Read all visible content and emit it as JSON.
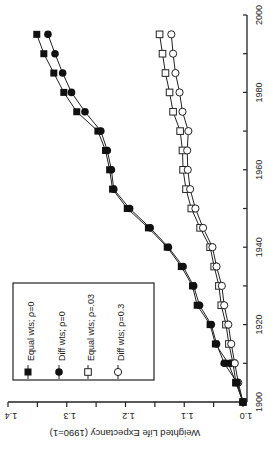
{
  "chart_data": {
    "type": "line",
    "orientation": "rotated-90-ccw",
    "title": "",
    "xlabel": "",
    "ylabel": "Weighted Life Expectancy (1990=1)",
    "xlim": [
      1900,
      2000
    ],
    "ylim": [
      1.0,
      1.4
    ],
    "xticks": [
      1900,
      1910,
      1920,
      1930,
      1940,
      1950,
      1960,
      1970,
      1980,
      1990,
      2000
    ],
    "xtick_labels": [
      "1900",
      "1920",
      "1940",
      "1960",
      "1980",
      "2000"
    ],
    "yticks": [
      1.0,
      1.05,
      1.1,
      1.15,
      1.2,
      1.25,
      1.3,
      1.35,
      1.4
    ],
    "ytick_labels": [
      "1.0",
      "1.1",
      "1.2",
      "1.3",
      "1.4"
    ],
    "grid": false,
    "legend_position": "bottom-left",
    "x": [
      1900,
      1905,
      1910,
      1915,
      1920,
      1925,
      1930,
      1935,
      1940,
      1945,
      1950,
      1955,
      1960,
      1965,
      1970,
      1975,
      1980,
      1985,
      1990,
      1995
    ],
    "series": [
      {
        "name": "Equal wts; ρ=0",
        "marker": "filled-square",
        "values": [
          1.0,
          1.012,
          1.025,
          1.047,
          1.056,
          1.078,
          1.086,
          1.105,
          1.129,
          1.161,
          1.197,
          1.222,
          1.227,
          1.234,
          1.247,
          1.283,
          1.305,
          1.322,
          1.339,
          1.351
        ]
      },
      {
        "name": "Diff wts; ρ=0",
        "marker": "filled-circle",
        "values": [
          1.0,
          1.01,
          1.032,
          1.045,
          1.054,
          1.074,
          1.084,
          1.102,
          1.127,
          1.158,
          1.193,
          1.22,
          1.224,
          1.231,
          1.242,
          1.269,
          1.292,
          1.307,
          1.32,
          1.332
        ]
      },
      {
        "name": "Equal wts; ρ=.03",
        "marker": "open-square",
        "values": [
          1.0,
          1.012,
          1.017,
          1.024,
          1.029,
          1.037,
          1.041,
          1.049,
          1.056,
          1.073,
          1.088,
          1.097,
          1.102,
          1.103,
          1.107,
          1.119,
          1.125,
          1.132,
          1.137,
          1.142
        ]
      },
      {
        "name": "Diff wts; ρ=0.3",
        "marker": "open-circle",
        "values": [
          1.0,
          1.008,
          1.014,
          1.02,
          1.025,
          1.032,
          1.036,
          1.045,
          1.052,
          1.068,
          1.081,
          1.09,
          1.094,
          1.095,
          1.093,
          1.103,
          1.108,
          1.115,
          1.119,
          1.122
        ]
      }
    ]
  }
}
